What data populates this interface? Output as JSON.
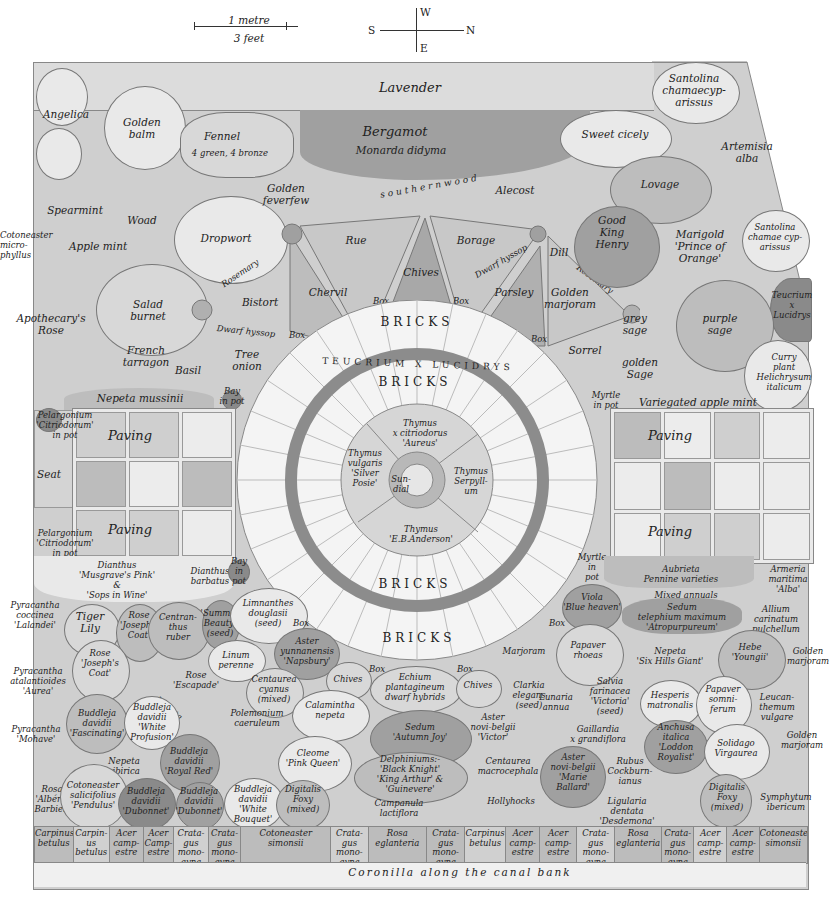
{
  "scale": {
    "metric": "1 metre",
    "imperial": "3 feet"
  },
  "compass": {
    "west": "W",
    "south": "S",
    "north": "N",
    "east": "E"
  },
  "colors": {
    "paper": "#ffffff",
    "wash_light": "#e9e9e9",
    "wash_mid": "#cfcfcf",
    "wash_dark": "#a0a0a0",
    "ink": "#222222"
  },
  "top_border": {
    "lavender": "Lavender",
    "santolina_corner": "Santolina\nchamaecyp-\narissus"
  },
  "north_west_beds": {
    "angelica": "Angelica",
    "golden_balm": "Golden\nbalm",
    "fennel": "Fennel",
    "fennel_note": "4 green, 4 bronze",
    "bergamot": "Bergamot",
    "bergamot_latin": "Monarda didyma",
    "spearmint": "Spearmint",
    "woad": "Woad",
    "dropwort": "Dropwort",
    "golden_feverfew": "Golden\nfeverfew",
    "apple_mint": "Apple mint",
    "cotoneaster": "Cotoneaster\nmicro-\nphyllus",
    "salad_burnet": "Salad\nburnet",
    "apothecarys_rose": "Apothecary's\nRose",
    "bistort": "Bistort",
    "rosemary_left": "Rosemary",
    "dwarf_hyssop_left": "Dwarf hyssop",
    "french_tarragon": "French\ntarragon",
    "basil": "Basil",
    "tree_onion": "Tree\nonion",
    "bay_in_pot": "Bay\nin pot",
    "nepeta_mussinii": "Nepeta mussinii"
  },
  "path": {
    "southernwood": "southernwood"
  },
  "herb_wedges": {
    "rue": "Rue",
    "chives": "Chives",
    "borage": "Borage",
    "chervil": "Chervil",
    "parsley": "Parsley",
    "dwarf_hyssop_right": "Dwarf hyssop",
    "dill": "Dill",
    "rosemary_right": "Rosemary",
    "golden_marjoram": "Golden\nmarjoram",
    "sorrel": "Sorrel",
    "box": "Box"
  },
  "north_east_beds": {
    "sweet_cicely": "Sweet cicely",
    "artemisia": "Artemisia\nalba",
    "alecost": "Alecost",
    "lovage": "Lovage",
    "good_king_henry": "Good\nKing\nHenry",
    "marigold": "Marigold\n'Prince of\nOrange'",
    "santolina": "Santolina\nchamae cyp-\narissus",
    "teucrium": "Teucrium\nx\nLucidrys",
    "grey_sage": "grey\nsage",
    "purple_sage": "purple\nsage",
    "golden_sage": "golden\nSage",
    "curry_plant": "Curry\nplant\nHelichrysum\nitalicum",
    "myrtle_top": "Myrtle\nin pot",
    "variegated_apple_mint": "Variegated apple mint"
  },
  "centre": {
    "bricks_outer_top": "BRICKS",
    "teucrium_ring": "TEUCRIUM X LUCIDRYS",
    "bricks_inner_top": "BRICKS",
    "bricks_inner_bottom": "BRICKS",
    "bricks_outer_bottom": "BRICKS",
    "thyme_top": "Thymus\nx citriodorus\n'Aureus'",
    "thyme_left": "Thymus\nvulgaris\n'Silver\nPosie'",
    "thyme_right": "Thymus\nSerpyll-\num",
    "thyme_bottom": "Thymus\n'E.B.Anderson'",
    "sundial": "Sun-\ndial"
  },
  "paving_areas": {
    "left": {
      "label_top": "Paving",
      "label_bottom": "Paving",
      "seat": "Seat",
      "pelargonium_top": "Pelargonium\n'Citriodorum'\nin pot",
      "pelargonium_bottom": "Pelargonium\n'Citriodorum'\nin pot"
    },
    "right": {
      "label_top": "Paving",
      "label_bottom": "Paving",
      "myrtle_bottom": "Myrtle\nin pot"
    }
  },
  "south_west_beds": {
    "dianthus": "Dianthus\n'Musgrave's Pink'\n&\n'Sops in Wine'",
    "dianthus_barbatus": "Dianthus\nbarbatus",
    "bay_in_pot": "Bay\nin\npot",
    "pyracantha_coccinea": "Pyracantha\ncoccinea\n'Lalandei'",
    "tiger_lily": "Tiger\nLily",
    "rose_josephs_coat_1": "Rose\n'Joseph's\nCoat'",
    "centranthus": "Centran-\nthus\nruber",
    "summer_beauty": "'Summer\nBeauty'\n(seed)",
    "limnanthes": "Limnanthes\ndouglasii\n(seed)",
    "rose_josephs_coat_2": "Rose\n'Joseph's\nCoat'",
    "linum": "Linum\nperenne",
    "pyracantha_atalantioides": "Pyracantha\natalantioides\n'Aurea'",
    "rose_escapade": "Rose\n'Escapade'",
    "nepeta_sibirica_diag": "Nepeta\nsibirica",
    "box": "Box",
    "aster_yunnanensis": "Aster\nyunnanensis\n'Napsbury'",
    "centaurea_cyanus": "Centaurea\ncyanus\n(mixed)",
    "polemonium": "Polemonium\ncaeruleum",
    "chives": "Chives",
    "calamintha": "Calamintha\nnepeta",
    "cleome": "Cleome\n'Pink Queen'",
    "pyracantha_mohave": "Pyracantha\n'Mohave'",
    "buddleja_fascinating": "Buddleja\ndavidii\n'Fascinating'",
    "buddleja_white_profusion": "Buddleja\ndavidii\n'White\nProfusion'",
    "buddleja_royal_red": "Buddleja\ndavidii\n'Royal Red'",
    "nepeta_sibirica": "Nepeta\nsibirica",
    "rosa_alberic": "Rosa\n'Albéric\nBarbier'",
    "cotoneaster_salicifolius": "Cotoneaster\nsalicifolius\n'Pendulus'",
    "buddleja_dubonnet_1": "Buddleja\ndavidii\n'Dubonnet'",
    "buddleja_dubonnet_2": "Buddleja\ndavidii\n'Dubonnet'",
    "buddleja_white_bouquet": "Buddleja\ndavidii\n'White\nBouquet'",
    "digitalis_left": "Digitalis\nFoxy\n(mixed)"
  },
  "south_centre_beds": {
    "box_left": "Box",
    "box_right": "Box",
    "echium": "Echium\nplantagineum\ndwarf hybrids",
    "chives": "Chives",
    "sedum_autumn_joy": "Sedum\n'Autumn Joy'",
    "delphiniums": "Delphiniums:-\n'Black Knight'\n'King Arthur' &\n'Guinevere'",
    "campanula": "Campanula\nlactiflora",
    "hollyhocks": "Hollyhocks",
    "centaurea_macrocephala": "Centaurea\nmacrocephala",
    "aster_victor": "Aster\nnovi-belgii\n'Victor'",
    "clarkia": "Clarkia\nelegans\n(seed)",
    "lunaria": "Lunaria\nannua",
    "marjoram": "Marjoram"
  },
  "south_east_beds": {
    "myrtle_in_pot": "Myrtle\nin\npot",
    "aubrieta": "Aubrieta\nPennine varieties",
    "armeria": "Armeria\nmaritima\n'Alba'",
    "viola": "Viola\n'Blue heaven'",
    "mixed_annuals": "Mixed annuals",
    "sedum_telephium": "Sedum\ntelephium maximum\n'Atropurpureum'",
    "allium": "Allium\ncarinatum\npulchellum",
    "box": "Box",
    "papaver_rhoeas": "Papaver\nrhoeas",
    "nepeta_six_hills": "Nepeta\n'Six Hills Giant'",
    "hebe": "Hebe\n'Youngii'",
    "golden_marjoram_top": "Golden\nmarjoram",
    "salvia": "Salvia\nfarinacea\n'Victoria'\n(seed)",
    "hesperis": "Hesperis\nmatronalis",
    "papaver_somniferum": "Papaver\nsomni-\nferum",
    "leucanthemum": "Leucan-\nthemum\nvulgare",
    "gaillardia": "Gaillardia\nx grandiflora",
    "anchusa": "Anchusa\nitalica\n'Loddon\nRoyalist'",
    "solidago": "Solidago\nVirgaurea",
    "golden_marjoram_bottom": "Golden\nmarjoram",
    "aster_marie_ballard": "Aster\nnovi-belgii\n'Marie\nBallard'",
    "rubus": "Rubus\nCockburn-\nianus",
    "ligularia": "Ligularia\ndentata\n'Desdemona'",
    "digitalis_right": "Digitalis\nFoxy\n(mixed)",
    "symphytum": "Symphytum\nibericum"
  },
  "hedge": [
    {
      "label": "Carpinus\nbetulus",
      "w": 38
    },
    {
      "label": "Carpin-\nus\nbetulus",
      "w": 36
    },
    {
      "label": "Acer\ncamp-\nestre",
      "w": 33
    },
    {
      "label": "Acer\nCamp-\nestre",
      "w": 30
    },
    {
      "label": "Crata-\ngus\nmono-\ngyna",
      "w": 34
    },
    {
      "label": "Crata-\ngus\nmono-\ngyna",
      "w": 32
    },
    {
      "label": "Cotoneaster\nsimonsii",
      "w": 90
    },
    {
      "label": "Crata-\ngus\nmono-\ngyna",
      "w": 37
    },
    {
      "label": "Rosa\neglanteria",
      "w": 58
    },
    {
      "label": "Crata-\ngus\nmono-\ngyna",
      "w": 38
    },
    {
      "label": "Carpinus\nbetulus",
      "w": 40
    },
    {
      "label": "Acer\ncamp-\nestre",
      "w": 34
    },
    {
      "label": "Acer\ncamp-\nestre",
      "w": 36
    },
    {
      "label": "Crata-\ngus\nmono-\ngyna",
      "w": 38
    },
    {
      "label": "Rosa\neglanteria",
      "w": 46
    },
    {
      "label": "Crata-\ngus\nmono-\ngyna",
      "w": 32
    },
    {
      "label": "Acer\ncamp-\nestre",
      "w": 32
    },
    {
      "label": "Acer\ncamp-\nestre",
      "w": 32
    },
    {
      "label": "Cotoneaster\nsimonsii",
      "w": 48
    }
  ],
  "bottom_border": {
    "coronilla": "Coronilla along the canal bank"
  }
}
